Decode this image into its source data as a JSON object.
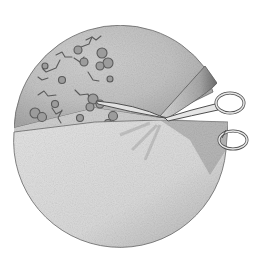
{
  "image": {
    "description": "Pencil illustration of a circular disc with scattered mold-like patches being cut by scissors",
    "style": "graphite pencil drawing",
    "colors": {
      "background": "#ffffff",
      "disc_light": "#e6e6e6",
      "disc_mid": "#c8c8c8",
      "disc_dark": "#9a9a9a",
      "patch": "#8a8a8a",
      "patch_outline": "#5a5a5a",
      "outline": "#555555"
    }
  }
}
